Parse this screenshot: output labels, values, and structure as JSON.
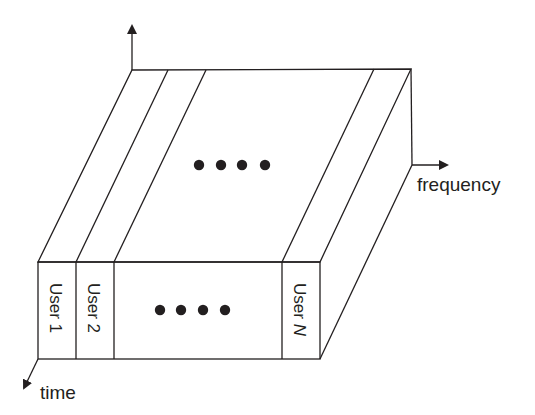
{
  "diagram": {
    "type": "FDMA time-frequency block",
    "axes": {
      "vertical": {
        "label": ""
      },
      "frequency": {
        "label": "frequency"
      },
      "time": {
        "label": "time"
      }
    },
    "users": [
      {
        "label": "User 1"
      },
      {
        "label": "User 2"
      },
      {
        "label": "User N",
        "prefix": "User ",
        "italic_suffix": "N"
      }
    ],
    "ellipsis_dots": 4,
    "colors": {
      "stroke": "#231f20",
      "background": "#ffffff"
    }
  }
}
